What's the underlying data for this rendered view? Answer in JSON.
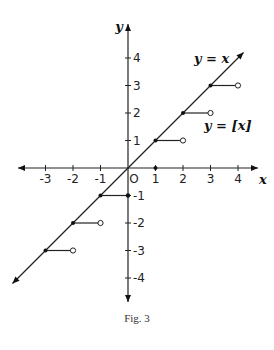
{
  "chart_data": {
    "type": "line",
    "title": "",
    "caption": "Fig. 3",
    "xlabel": "x",
    "ylabel": "y",
    "xlim": [
      -4.5,
      4.5
    ],
    "ylim": [
      -4.8,
      4.8
    ],
    "grid": false,
    "x_ticks": [
      -3,
      -2,
      -1,
      0,
      1,
      2,
      3,
      4
    ],
    "x_tick_labels": [
      "-3",
      "-2",
      "-1",
      "O",
      "1",
      "2",
      "3",
      "4"
    ],
    "y_ticks": [
      4,
      3,
      2,
      1,
      -1,
      -2,
      -3,
      -4
    ],
    "y_tick_labels": [
      "4",
      "3",
      "2",
      "1",
      "-1",
      "-2",
      "-3",
      "-4"
    ],
    "series": [
      {
        "name": "y = x",
        "type": "line",
        "x": [
          -4.2,
          4.2
        ],
        "y": [
          -4.2,
          4.2
        ],
        "arrows": "both"
      },
      {
        "name": "y = [x]",
        "type": "step",
        "segments": [
          {
            "x_start": -3,
            "x_end": -2,
            "y": -3,
            "start": "closed",
            "end": "open"
          },
          {
            "x_start": -2,
            "x_end": -1,
            "y": -2,
            "start": "closed",
            "end": "open"
          },
          {
            "x_start": -1,
            "x_end": 0,
            "y": -1,
            "start": "closed",
            "end": "open"
          },
          {
            "x_start": 0,
            "x_end": 1,
            "y": 0,
            "start": "closed",
            "end": "open"
          },
          {
            "x_start": 1,
            "x_end": 2,
            "y": 1,
            "start": "closed",
            "end": "open"
          },
          {
            "x_start": 2,
            "x_end": 3,
            "y": 2,
            "start": "closed",
            "end": "open"
          },
          {
            "x_start": 3,
            "x_end": 4,
            "y": 3,
            "start": "closed",
            "end": "open"
          }
        ]
      }
    ],
    "annotations": [
      {
        "text": "y = x",
        "x": 3.2,
        "y": 3.7
      },
      {
        "text": "y = [x]",
        "x": 3.3,
        "y": 1.4
      }
    ]
  },
  "labels": {
    "x_axis": "x",
    "y_axis": "y",
    "line_label": "y = x",
    "floor_label": "y = [x]",
    "caption": "Fig. 3"
  }
}
